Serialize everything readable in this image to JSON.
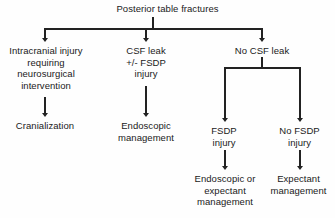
{
  "diagram": {
    "title": "Posterior table fractures",
    "nodes": {
      "root": "Posterior table fractures",
      "intracranial": "Intracranial injury\nrequiring\nneurosurgical\nintervention",
      "csf_leak": "CSF leak\n+/- FSDP\ninjury",
      "no_csf_leak": "No CSF leak",
      "cranialization": "Cranialization",
      "endoscopic_management": "Endoscopic\nmanagement",
      "fsdp_injury": "FSDP\ninjury",
      "no_fsdp_injury": "No FSDP\ninjury",
      "endoscopic_or_expectant": "Endoscopic or\nexpectant\nmanagement",
      "expectant_management": "Expectant\nmanagement"
    },
    "colors": {
      "background": "#fefefe",
      "text": "#1a1a1a",
      "line": "#222222"
    }
  }
}
